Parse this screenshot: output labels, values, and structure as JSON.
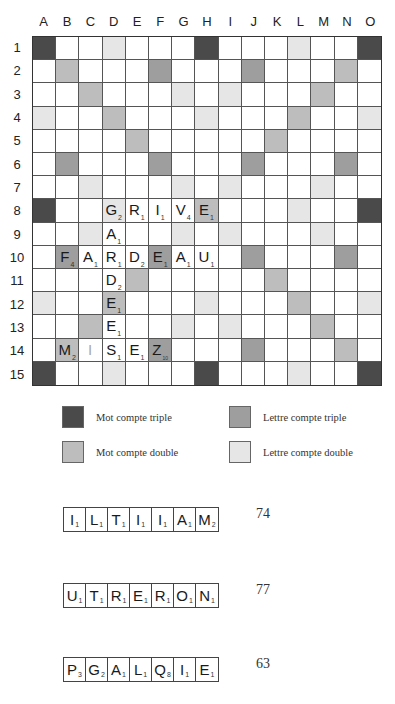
{
  "board": {
    "columns": [
      "A",
      "B",
      "C",
      "D",
      "E",
      "F",
      "G",
      "H",
      "I",
      "J",
      "K",
      "L",
      "M",
      "N",
      "O"
    ],
    "rows": [
      "1",
      "2",
      "3",
      "4",
      "5",
      "6",
      "7",
      "8",
      "9",
      "10",
      "11",
      "12",
      "13",
      "14",
      "15"
    ],
    "premium_layout": [
      "tw..dl...tw...dl..tw",
      "placeholder"
    ],
    "premium_grid": [
      [
        "tw",
        "",
        "",
        "dl",
        "",
        "",
        "",
        "tw",
        "",
        "",
        "",
        "dl",
        "",
        "",
        "tw"
      ],
      [
        "",
        "dw",
        "",
        "",
        "",
        "tl",
        "",
        "",
        "",
        "tl",
        "",
        "",
        "",
        "dw",
        ""
      ],
      [
        "",
        "",
        "dw",
        "",
        "",
        "",
        "dl",
        "",
        "dl",
        "",
        "",
        "",
        "dw",
        "",
        ""
      ],
      [
        "dl",
        "",
        "",
        "dw",
        "",
        "",
        "",
        "dl",
        "",
        "",
        "",
        "dw",
        "",
        "",
        "dl"
      ],
      [
        "",
        "",
        "",
        "",
        "dw",
        "",
        "",
        "",
        "",
        "",
        "dw",
        "",
        "",
        "",
        ""
      ],
      [
        "",
        "tl",
        "",
        "",
        "",
        "tl",
        "",
        "",
        "",
        "tl",
        "",
        "",
        "",
        "tl",
        ""
      ],
      [
        "",
        "",
        "dl",
        "",
        "",
        "",
        "dl",
        "",
        "dl",
        "",
        "",
        "",
        "dl",
        "",
        ""
      ],
      [
        "tw",
        "",
        "",
        "dl",
        "",
        "",
        "",
        "dw",
        "",
        "",
        "",
        "dl",
        "",
        "",
        "tw"
      ],
      [
        "",
        "",
        "dl",
        "",
        "",
        "",
        "dl",
        "",
        "dl",
        "",
        "",
        "",
        "dl",
        "",
        ""
      ],
      [
        "",
        "tl",
        "",
        "",
        "",
        "tl",
        "",
        "",
        "",
        "tl",
        "",
        "",
        "",
        "tl",
        ""
      ],
      [
        "",
        "",
        "",
        "",
        "dw",
        "",
        "",
        "",
        "",
        "",
        "dw",
        "",
        "",
        "",
        ""
      ],
      [
        "dl",
        "",
        "",
        "dw",
        "",
        "",
        "",
        "dl",
        "",
        "",
        "",
        "dw",
        "",
        "",
        "dl"
      ],
      [
        "",
        "",
        "dw",
        "",
        "",
        "",
        "dl",
        "",
        "dl",
        "",
        "",
        "",
        "dw",
        "",
        ""
      ],
      [
        "",
        "dw",
        "",
        "",
        "",
        "tl",
        "",
        "",
        "",
        "tl",
        "",
        "",
        "",
        "dw",
        ""
      ],
      [
        "tw",
        "",
        "",
        "dl",
        "",
        "",
        "",
        "tw",
        "",
        "",
        "",
        "dl",
        "",
        "",
        "tw"
      ]
    ],
    "tiles": [
      {
        "row": 8,
        "col": 4,
        "letter": "G",
        "value": "2"
      },
      {
        "row": 8,
        "col": 5,
        "letter": "R",
        "value": "1"
      },
      {
        "row": 8,
        "col": 6,
        "letter": "I",
        "value": "1"
      },
      {
        "row": 8,
        "col": 7,
        "letter": "V",
        "value": "4"
      },
      {
        "row": 8,
        "col": 8,
        "letter": "E",
        "value": "1"
      },
      {
        "row": 9,
        "col": 4,
        "letter": "A",
        "value": "1"
      },
      {
        "row": 10,
        "col": 2,
        "letter": "F",
        "value": "4"
      },
      {
        "row": 10,
        "col": 3,
        "letter": "A",
        "value": "1"
      },
      {
        "row": 10,
        "col": 4,
        "letter": "R",
        "value": "1"
      },
      {
        "row": 10,
        "col": 5,
        "letter": "D",
        "value": "2"
      },
      {
        "row": 10,
        "col": 6,
        "letter": "E",
        "value": "1"
      },
      {
        "row": 10,
        "col": 7,
        "letter": "A",
        "value": "1"
      },
      {
        "row": 10,
        "col": 8,
        "letter": "U",
        "value": "1"
      },
      {
        "row": 11,
        "col": 4,
        "letter": "D",
        "value": "2"
      },
      {
        "row": 12,
        "col": 4,
        "letter": "E",
        "value": "1"
      },
      {
        "row": 13,
        "col": 4,
        "letter": "E",
        "value": "1"
      },
      {
        "row": 14,
        "col": 2,
        "letter": "M",
        "value": "2"
      },
      {
        "row": 14,
        "col": 3,
        "letter": "I",
        "value": "",
        "blank": true
      },
      {
        "row": 14,
        "col": 4,
        "letter": "S",
        "value": "1"
      },
      {
        "row": 14,
        "col": 5,
        "letter": "E",
        "value": "1"
      },
      {
        "row": 14,
        "col": 6,
        "letter": "Z",
        "value": "10"
      }
    ]
  },
  "legend": {
    "items": [
      {
        "label": "Mot compte triple",
        "type": "tw",
        "color": "#4a4a4a"
      },
      {
        "label": "Lettre compte triple",
        "type": "tl",
        "color": "#9e9e9e"
      },
      {
        "label": "Mot compte double",
        "type": "dw",
        "color": "#bdbdbd"
      },
      {
        "label": "Lettre compte double",
        "type": "dl",
        "color": "#e6e6e6"
      }
    ]
  },
  "racks": [
    {
      "tiles": [
        {
          "letter": "I",
          "value": "1"
        },
        {
          "letter": "L",
          "value": "1"
        },
        {
          "letter": "T",
          "value": "1"
        },
        {
          "letter": "I",
          "value": "1"
        },
        {
          "letter": "I",
          "value": "1"
        },
        {
          "letter": "A",
          "value": "1"
        },
        {
          "letter": "M",
          "value": "2"
        }
      ],
      "score": "74"
    },
    {
      "tiles": [
        {
          "letter": "U",
          "value": "1"
        },
        {
          "letter": "T",
          "value": "1"
        },
        {
          "letter": "R",
          "value": "1"
        },
        {
          "letter": "E",
          "value": "1"
        },
        {
          "letter": "R",
          "value": "1"
        },
        {
          "letter": "O",
          "value": "1"
        },
        {
          "letter": "N",
          "value": "1"
        }
      ],
      "score": "77"
    },
    {
      "tiles": [
        {
          "letter": "P",
          "value": "3"
        },
        {
          "letter": "G",
          "value": "2"
        },
        {
          "letter": "A",
          "value": "1"
        },
        {
          "letter": "L",
          "value": "1"
        },
        {
          "letter": "Q",
          "value": "8"
        },
        {
          "letter": "I",
          "value": "1"
        },
        {
          "letter": "E",
          "value": "1"
        }
      ],
      "score": "63"
    }
  ]
}
